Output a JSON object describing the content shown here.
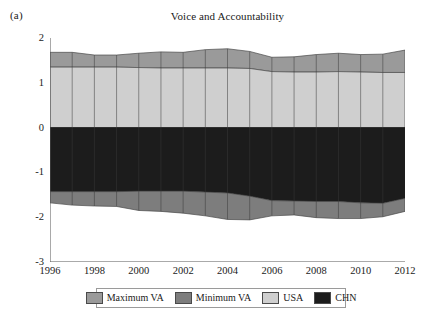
{
  "panel": {
    "label": "(a)"
  },
  "legend": {
    "items": [
      {
        "label": "Maximum VA",
        "color": "#9a9a9a"
      },
      {
        "label": "Minimum VA",
        "color": "#7d7d7d"
      },
      {
        "label": "USA",
        "color": "#cfcfcf"
      },
      {
        "label": "CHN",
        "color": "#1c1c1c"
      }
    ]
  },
  "chart_data": {
    "type": "area",
    "title": "Voice and Accountability",
    "xlabel": "",
    "ylabel": "",
    "xlim": [
      1996,
      2012
    ],
    "ylim": [
      -3,
      2
    ],
    "yticks": [
      2,
      1,
      0,
      -1,
      -2,
      -3
    ],
    "xticks": [
      1996,
      1997,
      1998,
      1999,
      2000,
      2001,
      2002,
      2003,
      2004,
      2005,
      2006,
      2007,
      2008,
      2009,
      2010,
      2011,
      2012
    ],
    "xtick_labels": [
      1996,
      1998,
      2000,
      2002,
      2004,
      2006,
      2008,
      2010,
      2012
    ],
    "grid": false,
    "stacking": "band-boundaries",
    "x": [
      1996,
      1997,
      1998,
      1999,
      2000,
      2001,
      2002,
      2003,
      2004,
      2005,
      2006,
      2007,
      2008,
      2009,
      2010,
      2011,
      2012
    ],
    "series": [
      {
        "name": "Maximum VA",
        "color": "#9a9a9a",
        "role": "upper-band-top",
        "values": [
          1.68,
          1.68,
          1.62,
          1.62,
          1.66,
          1.69,
          1.68,
          1.74,
          1.76,
          1.7,
          1.57,
          1.58,
          1.63,
          1.66,
          1.63,
          1.64,
          1.73
        ]
      },
      {
        "name": "USA",
        "color": "#cfcfcf",
        "role": "upper-band-bottom",
        "values": [
          1.35,
          1.35,
          1.35,
          1.35,
          1.34,
          1.33,
          1.33,
          1.33,
          1.33,
          1.32,
          1.25,
          1.24,
          1.24,
          1.25,
          1.24,
          1.23,
          1.23
        ]
      },
      {
        "name": "CHN",
        "color": "#1c1c1c",
        "role": "lower-band-top",
        "values": [
          -1.43,
          -1.43,
          -1.43,
          -1.43,
          -1.42,
          -1.42,
          -1.42,
          -1.44,
          -1.46,
          -1.53,
          -1.63,
          -1.64,
          -1.65,
          -1.65,
          -1.68,
          -1.69,
          -1.58
        ]
      },
      {
        "name": "Minimum VA",
        "color": "#7d7d7d",
        "role": "lower-band-bottom",
        "values": [
          -1.68,
          -1.73,
          -1.75,
          -1.76,
          -1.85,
          -1.87,
          -1.91,
          -1.97,
          -2.05,
          -2.06,
          -1.97,
          -1.95,
          -2.01,
          -2.03,
          -2.03,
          -1.99,
          -1.87
        ]
      }
    ],
    "zero_baseline": 0
  }
}
